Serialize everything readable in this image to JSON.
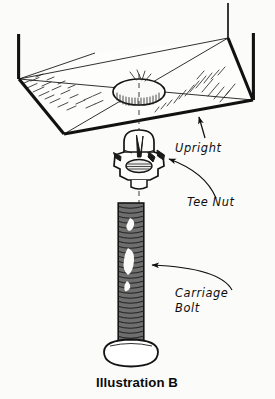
{
  "figure": {
    "caption": "Illustration B",
    "background_color": "#fbfbfa",
    "ink_color": "#111111",
    "type": "technical-assembly-illustration"
  },
  "annotations": [
    {
      "id": "upright",
      "label": "Upright",
      "leader": "straight-arrow",
      "points_to": "panel-bottom-edge"
    },
    {
      "id": "tee-nut",
      "label": "Tee Nut",
      "leader": "curved-arrow",
      "points_to": "tee-nut-flange"
    },
    {
      "id": "carriage-bolt",
      "label_line1": "Carriage",
      "label_line2": "Bolt",
      "leader": "curved-arrow",
      "points_to": "bolt-shaft"
    }
  ],
  "parts": {
    "upright": {
      "name": "Upright",
      "description": "Angled board shown in perspective with a drilled hole at center"
    },
    "hole": {
      "name": "Drilled hole",
      "description": "Elliptical bore through the upright, hatched inside"
    },
    "tee_nut": {
      "name": "Tee Nut",
      "description": "Domed barrel with four spiked prongs and a flanged base"
    },
    "carriage_bolt": {
      "name": "Carriage Bolt",
      "description": "Threaded shank with a rounded dome head"
    },
    "centerline": {
      "name": "Assembly centerline",
      "style": "dashed"
    }
  }
}
